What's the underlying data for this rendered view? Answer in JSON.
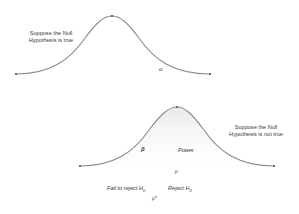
{
  "top_panel": {
    "hypothesis_label_line1": "Suppose the Null",
    "hypothesis_label_line2": "Hypothesis is true",
    "alpha_symbol": "α"
  },
  "bottom_panel": {
    "hypothesis_label_line1": "Suppose the Null",
    "hypothesis_label_line2": "Hypothesis is not true",
    "beta_symbol": "β",
    "power_label": "Power",
    "mu_symbol": "μ",
    "fail_to_reject_label": "Fail to reject H",
    "reject_label": "Reject H",
    "h_subscript": "0",
    "mu_star_symbol": "μ*"
  },
  "colors": {
    "curve": "#8a8a8a",
    "point": "#555555",
    "shade": "#e8e8e8",
    "text": "#3a3a3a"
  }
}
